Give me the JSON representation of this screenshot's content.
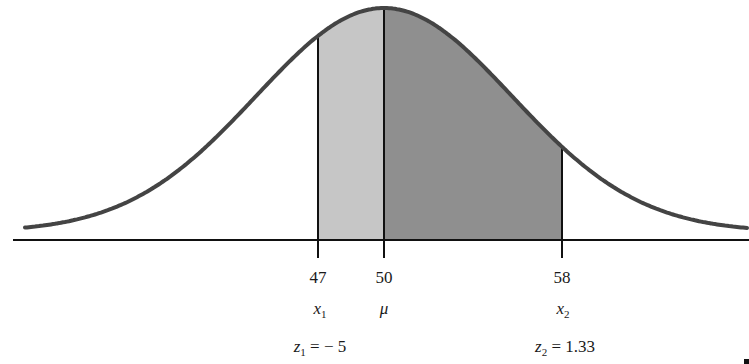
{
  "figure": {
    "type": "normal-distribution-area",
    "mean": 50,
    "colors": {
      "curve": "#444444",
      "axis": "#111111",
      "shade_left": "#c6c6c6",
      "shade_right": "#8f8f8f",
      "background": "#ffffff"
    },
    "markers": [
      {
        "value": "47",
        "symbol": "x",
        "subscript": "1",
        "z_label_var": "z",
        "z_label_sub": "1",
        "z_label_eq": "= − 5"
      },
      {
        "value": "50",
        "symbol": "μ"
      },
      {
        "value": "58",
        "symbol": "x",
        "subscript": "2",
        "z_label_var": "z",
        "z_label_sub": "2",
        "z_label_eq": "= 1.33"
      }
    ],
    "shaded_regions": [
      {
        "from": "47",
        "to": "50",
        "shade": "light"
      },
      {
        "from": "50",
        "to": "58",
        "shade": "dark"
      }
    ]
  }
}
